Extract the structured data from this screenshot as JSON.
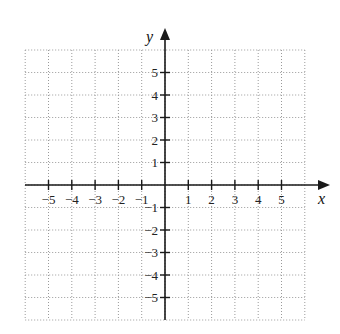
{
  "graph": {
    "type": "coordinate-plane",
    "x_axis_label": "x",
    "y_axis_label": "y",
    "x_ticks": [
      "−5",
      "−4",
      "−3",
      "−2",
      "−1",
      "1",
      "2",
      "3",
      "4",
      "5"
    ],
    "x_tick_values": [
      -5,
      -4,
      -3,
      -2,
      -1,
      1,
      2,
      3,
      4,
      5
    ],
    "y_ticks": [
      "5",
      "4",
      "3",
      "2",
      "1",
      "−1",
      "−2",
      "−3",
      "−4",
      "−5"
    ],
    "y_tick_values": [
      5,
      4,
      3,
      2,
      1,
      -1,
      -2,
      -3,
      -4,
      -5
    ],
    "grid_range": {
      "x": [
        -6,
        6
      ],
      "y": [
        -6,
        6
      ]
    },
    "grid_style": "dotted",
    "colors": {
      "axis": "#1a1a1a",
      "grid": "#9a9a9a",
      "background": "#ffffff"
    }
  }
}
